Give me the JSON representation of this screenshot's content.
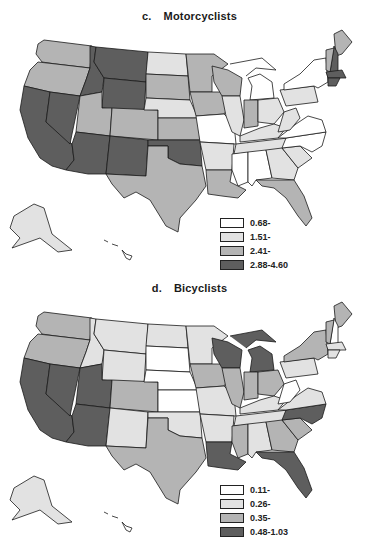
{
  "figure": {
    "colors": {
      "class1": "#ffffff",
      "class2": "#e2e2e2",
      "class3": "#b4b4b4",
      "class4": "#5e5e5e",
      "stroke": "#1a1a1a"
    }
  },
  "panels": [
    {
      "id": "c",
      "letter": "c.",
      "title": "Motorcyclists",
      "legend": [
        {
          "label": "0.68-",
          "class": 1
        },
        {
          "label": "1.51-",
          "class": 2
        },
        {
          "label": "2.41-",
          "class": 3
        },
        {
          "label": "2.88-4.60",
          "class": 4
        }
      ],
      "states": {
        "WA": 3,
        "OR": 3,
        "CA": 4,
        "NV": 4,
        "ID": 4,
        "MT": 4,
        "WY": 4,
        "UT": 3,
        "CO": 3,
        "AZ": 4,
        "NM": 4,
        "ND": 2,
        "SD": 3,
        "NE": 2,
        "KS": 3,
        "OK": 4,
        "TX": 3,
        "MN": 3,
        "IA": 3,
        "MO": 1,
        "AR": 2,
        "LA": 3,
        "WI": 3,
        "IL": 2,
        "MI": 1,
        "IN": 3,
        "OH": 2,
        "KY": 2,
        "TN": 2,
        "MS": 1,
        "AL": 1,
        "GA": 2,
        "FL": 3,
        "SC": 2,
        "NC": 1,
        "VA": 1,
        "WV": 2,
        "PA": 2,
        "NY": 1,
        "ME": 3,
        "NH": 4,
        "VT": 3,
        "MA": 4,
        "CT": 4,
        "AK": 2,
        "HI": 1
      }
    },
    {
      "id": "d",
      "letter": "d.",
      "title": "Bicyclists",
      "legend": [
        {
          "label": "0.11-",
          "class": 1
        },
        {
          "label": "0.26-",
          "class": 2
        },
        {
          "label": "0.35-",
          "class": 3
        },
        {
          "label": "0.48-1.03",
          "class": 4
        }
      ],
      "states": {
        "WA": 3,
        "OR": 3,
        "CA": 4,
        "NV": 4,
        "ID": 2,
        "MT": 2,
        "WY": 2,
        "UT": 4,
        "CO": 3,
        "AZ": 4,
        "NM": 2,
        "ND": 2,
        "SD": 1,
        "NE": 1,
        "KS": 1,
        "OK": 2,
        "TX": 3,
        "MN": 2,
        "IA": 3,
        "MO": 2,
        "AR": 2,
        "LA": 4,
        "WI": 4,
        "IL": 3,
        "MI": 4,
        "IN": 3,
        "OH": 3,
        "KY": 2,
        "TN": 2,
        "MS": 3,
        "AL": 2,
        "GA": 3,
        "FL": 4,
        "SC": 3,
        "NC": 4,
        "VA": 2,
        "WV": 1,
        "PA": 2,
        "NY": 3,
        "ME": 3,
        "NH": 1,
        "VT": 3,
        "MA": 2,
        "CT": 2,
        "AK": 2,
        "HI": 1
      }
    }
  ]
}
